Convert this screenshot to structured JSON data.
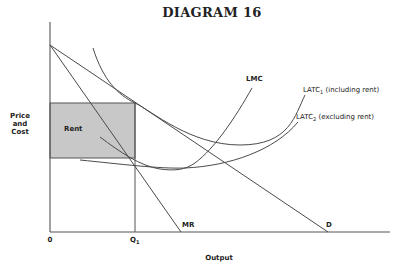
{
  "diagram": {
    "title": "DIAGRAM 16",
    "y_axis_label_lines": [
      "Price",
      "and",
      "Cost"
    ],
    "x_axis_label": "Output",
    "origin_label": "0",
    "q1_label_main": "Q",
    "q1_label_sub": "1",
    "rent_label": "Rent",
    "curves": {
      "lmc": "LMC",
      "latc1_main": "LATC",
      "latc1_sub": "1",
      "latc1_note": "(including rent)",
      "latc2_main": "LATC",
      "latc2_sub": "2",
      "latc2_note": "(excluding rent)",
      "mr": "MR",
      "d": "D"
    },
    "colors": {
      "rent_fill": "#c8c8c8",
      "line": "#4a4a4a",
      "background": "#ffffff"
    }
  }
}
